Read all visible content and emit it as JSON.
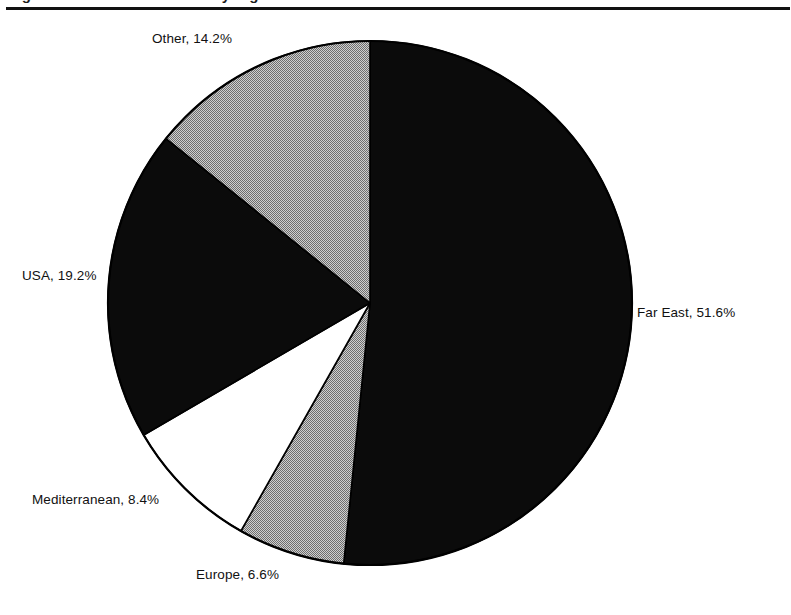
{
  "document": {
    "title_fragment": "Figure: World market share by region",
    "rule_color": "#121212",
    "background": "#ffffff"
  },
  "chart_data": {
    "type": "pie",
    "title": "",
    "xlabel": "",
    "ylabel": "",
    "legend_position": "none",
    "label_style": "outside-callout",
    "start_angle_deg": 0,
    "direction": "clockwise",
    "units": "percent",
    "categories": [
      "Far East",
      "Europe",
      "Mediterranean",
      "USA",
      "Other"
    ],
    "values": [
      51.6,
      6.6,
      8.4,
      19.2,
      14.2
    ],
    "slices": [
      {
        "name": "Far East",
        "value": 51.6,
        "label": "Far East, 51.6%",
        "fill": "#0b0b0b",
        "fill_style": "solid-black",
        "label_anchor": "right"
      },
      {
        "name": "Europe",
        "value": 6.6,
        "label": "Europe, 6.6%",
        "fill": "#a6a6a6",
        "fill_style": "gray-dither",
        "label_anchor": "bottom"
      },
      {
        "name": "Mediterranean",
        "value": 8.4,
        "label": "Mediterranean, 8.4%",
        "fill": "#ffffff",
        "fill_style": "white",
        "label_anchor": "bottom-left"
      },
      {
        "name": "USA",
        "value": 19.2,
        "label": "USA, 19.2%",
        "fill": "#0b0b0b",
        "fill_style": "solid-black",
        "label_anchor": "left"
      },
      {
        "name": "Other",
        "value": 14.2,
        "label": "Other, 14.2%",
        "fill": "#a6a6a6",
        "fill_style": "gray-dither",
        "label_anchor": "top-left"
      }
    ],
    "geometry": {
      "center_x": 370,
      "center_y": 303,
      "radius": 262,
      "outline_color": "#000000"
    }
  }
}
